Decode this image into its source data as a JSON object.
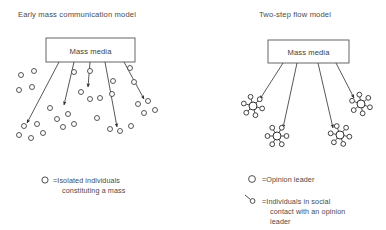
{
  "figure": {
    "width": 386,
    "height": 230,
    "background": "#ffffff",
    "ink": "#3a3a3a"
  },
  "panels": [
    {
      "id": "early-mass-communication",
      "title": "Early mass communication model",
      "title_x": 18,
      "title_y": 17,
      "source_box": {
        "label": "Mass media",
        "x": 46,
        "y": 38,
        "width": 89,
        "height": 24,
        "label_x": 90.5,
        "label_y": 53.5
      },
      "arrows": [
        {
          "x1": 59,
          "y1": 62,
          "x2": 27,
          "y2": 123
        },
        {
          "x1": 74,
          "y1": 62,
          "x2": 64,
          "y2": 105
        },
        {
          "x1": 90,
          "y1": 62,
          "x2": 88,
          "y2": 87
        },
        {
          "x1": 105,
          "y1": 62,
          "x2": 117,
          "y2": 127
        },
        {
          "x1": 124,
          "y1": 62,
          "x2": 144,
          "y2": 99
        }
      ],
      "mass_dots": [
        {
          "cx": 21,
          "cy": 75
        },
        {
          "cx": 34,
          "cy": 71
        },
        {
          "cx": 19,
          "cy": 90
        },
        {
          "cx": 32,
          "cy": 87
        },
        {
          "cx": 24,
          "cy": 126
        },
        {
          "cx": 37,
          "cy": 124
        },
        {
          "cx": 19,
          "cy": 135
        },
        {
          "cx": 31,
          "cy": 138
        },
        {
          "cx": 43,
          "cy": 133
        },
        {
          "cx": 50,
          "cy": 108
        },
        {
          "cx": 57,
          "cy": 119
        },
        {
          "cx": 68,
          "cy": 114
        },
        {
          "cx": 63,
          "cy": 127
        },
        {
          "cx": 74,
          "cy": 124
        },
        {
          "cx": 74,
          "cy": 72
        },
        {
          "cx": 90,
          "cy": 71
        },
        {
          "cx": 81,
          "cy": 92
        },
        {
          "cx": 90,
          "cy": 99
        },
        {
          "cx": 100,
          "cy": 98
        },
        {
          "cx": 97,
          "cy": 118
        },
        {
          "cx": 110,
          "cy": 129
        },
        {
          "cx": 120,
          "cy": 131
        },
        {
          "cx": 131,
          "cy": 126
        },
        {
          "cx": 113,
          "cy": 81
        },
        {
          "cx": 112,
          "cy": 94
        },
        {
          "cx": 130,
          "cy": 68
        },
        {
          "cx": 134,
          "cy": 82
        },
        {
          "cx": 138,
          "cy": 104
        },
        {
          "cx": 148,
          "cy": 101
        },
        {
          "cx": 144,
          "cy": 113
        },
        {
          "cx": 155,
          "cy": 110
        }
      ],
      "legend": [
        {
          "symbol": "circle",
          "symbol_x": 45,
          "symbol_y": 180,
          "text": "=Isolated individuals",
          "text_x": 53,
          "text_y": 183,
          "lines": [
            "=Isolated individuals",
            "constituting a mass"
          ],
          "line_x": [
            53,
            62
          ],
          "line_y": [
            183,
            193
          ]
        }
      ]
    },
    {
      "id": "two-step-flow",
      "title": "Two-step flow model",
      "title_x": 259,
      "title_y": 17,
      "source_box": {
        "label": "Mass media",
        "x": 268,
        "y": 40,
        "width": 81,
        "height": 23,
        "label_x": 308.5,
        "label_y": 55
      },
      "arrows": [
        {
          "x1": 283,
          "y1": 63,
          "x2": 260,
          "y2": 99
        },
        {
          "x1": 297,
          "y1": 63,
          "x2": 283,
          "y2": 128
        },
        {
          "x1": 318,
          "y1": 63,
          "x2": 333,
          "y2": 128
        },
        {
          "x1": 336,
          "y1": 63,
          "x2": 354,
          "y2": 98
        },
        {
          "x1": 283,
          "y1": 63,
          "x2": 283,
          "y2": 63
        }
      ],
      "clusters": [
        {
          "cx": 253,
          "cy": 106,
          "hub_r": 4.0,
          "spoke_r": 2.4,
          "len": 9.5,
          "n": 6,
          "rot": 15
        },
        {
          "cx": 277,
          "cy": 136,
          "hub_r": 4.0,
          "spoke_r": 2.4,
          "len": 9.5,
          "n": 6,
          "rot": 0
        },
        {
          "cx": 340,
          "cy": 135,
          "hub_r": 4.0,
          "spoke_r": 2.4,
          "len": 9.5,
          "n": 6,
          "rot": 10
        },
        {
          "cx": 361,
          "cy": 104,
          "hub_r": 4.0,
          "spoke_r": 2.4,
          "len": 9.5,
          "n": 6,
          "rot": 20
        }
      ],
      "legend": [
        {
          "symbol": "circle",
          "symbol_x": 252,
          "symbol_y": 179,
          "text": "=Opinion leader",
          "lines": [
            "=Opinion leader"
          ],
          "line_x": [
            262
          ],
          "line_y": [
            182
          ]
        },
        {
          "symbol": "spoke-circle",
          "symbol_x": 252,
          "symbol_y": 201,
          "lines": [
            "=Individuals in social",
            "contact with an opinion",
            "leader"
          ],
          "line_x": [
            262,
            270,
            270
          ],
          "line_y": [
            204,
            214,
            224
          ]
        }
      ]
    }
  ]
}
